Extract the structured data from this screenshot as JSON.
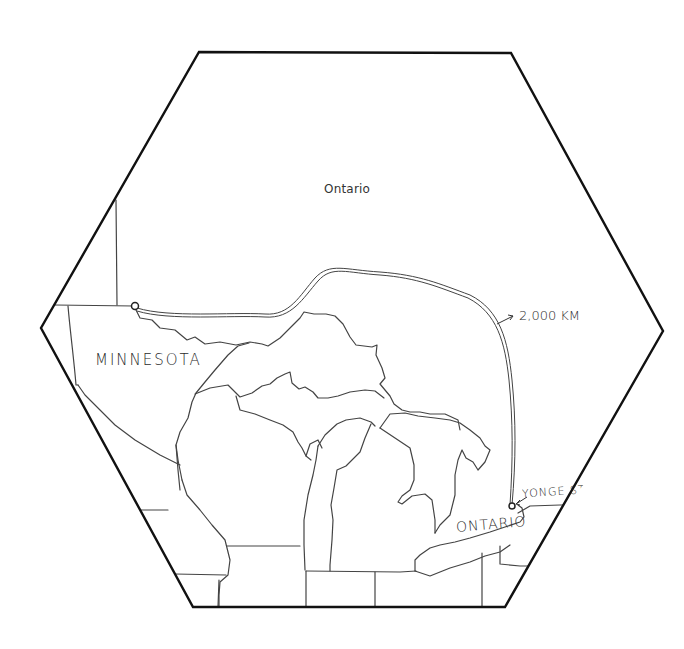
{
  "map": {
    "frame_shape": "hexagon",
    "labels": {
      "region_top": "Ontario",
      "state_left": "MINNESOTA",
      "province_bottom": "ONTARIO",
      "distance": "2,000 KM",
      "street": "YONGE STR"
    },
    "route": {
      "start_marker": "circle-marker",
      "end_marker": "circle-marker",
      "distance_label": "2,000 KM",
      "end_label": "YONGE STR"
    },
    "colors": {
      "frame": "#111111",
      "borders": "#444444",
      "route": "#444444",
      "background": "#ffffff"
    }
  }
}
